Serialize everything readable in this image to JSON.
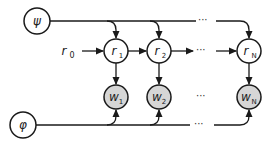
{
  "diagram": {
    "type": "graphical-model",
    "colors": {
      "stroke": "#1a1a1a",
      "observed_fill": "#d6d6d6",
      "latent_fill": "#ffffff"
    },
    "global_nodes": [
      {
        "id": "psi",
        "symbol": "ψ",
        "x": 37,
        "y": 21
      },
      {
        "id": "phi",
        "symbol": "φ",
        "x": 23,
        "y": 125
      }
    ],
    "initial": {
      "symbol": "r",
      "sub": "0",
      "x": 66,
      "y": 51
    },
    "r_nodes": [
      {
        "id": "r1",
        "symbol": "r",
        "sub": "1",
        "x": 116,
        "y": 51
      },
      {
        "id": "r2",
        "symbol": "r",
        "sub": "2",
        "x": 159,
        "y": 51
      },
      {
        "id": "rN",
        "symbol": "r",
        "sub": "N",
        "x": 249,
        "y": 51
      }
    ],
    "w_nodes": [
      {
        "id": "w1",
        "symbol": "w",
        "sub": "1",
        "x": 116,
        "y": 97,
        "observed": true
      },
      {
        "id": "w2",
        "symbol": "w",
        "sub": "2",
        "x": 159,
        "y": 97,
        "observed": true
      },
      {
        "id": "wN",
        "symbol": "w",
        "sub": "N",
        "x": 249,
        "y": 97,
        "observed": true
      }
    ],
    "ellipsis": "···",
    "edges": [
      "psi→r1",
      "psi→r2",
      "psi→rN",
      "r0→r1",
      "r1→r2",
      "r2→…",
      "…→rN",
      "r1→w1",
      "r2→w2",
      "rN→wN",
      "phi→w1",
      "phi→w2",
      "phi→wN"
    ]
  }
}
